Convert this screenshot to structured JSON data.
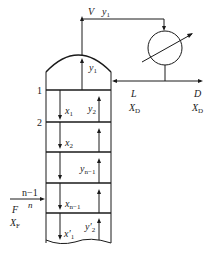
{
  "diagram": {
    "column": {
      "trays": [
        {
          "number": "1"
        },
        {
          "number": "2"
        }
      ],
      "feed_tray_labels": {
        "above": "n−1",
        "at": "n"
      }
    },
    "labels": {
      "vapor_top": {
        "main": "V",
        "var": "y",
        "sub": "1"
      },
      "top_vapor_inside": {
        "var": "y",
        "sub": "1"
      },
      "x1": {
        "var": "x",
        "sub": "1"
      },
      "y2": {
        "var": "y",
        "sub": "2"
      },
      "x2": {
        "var": "x",
        "sub": "2"
      },
      "yn1": {
        "var": "y",
        "sub": "n−1"
      },
      "xn1": {
        "var": "x",
        "sub": "n−1"
      },
      "x1p": {
        "var": "x′",
        "sub": "1"
      },
      "y2p": {
        "var": "y′",
        "sub": "2"
      },
      "reflux": {
        "main": "L",
        "var": "X",
        "sub": "D"
      },
      "distillate": {
        "main": "D",
        "var": "X",
        "sub": "D"
      },
      "feed": {
        "main": "F",
        "var": "X",
        "sub": "F"
      }
    },
    "components": [
      "column",
      "condenser",
      "reflux-line",
      "distillate-line",
      "feed-line"
    ]
  }
}
